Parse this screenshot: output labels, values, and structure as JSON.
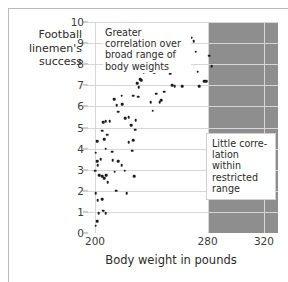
{
  "figure": {
    "ylabel": "Football linemen's success",
    "xlabel": "Body weight in pounds",
    "annotations": {
      "broad": "Greater correlation over broad range of body weights",
      "restricted": "Little corre-lation within restricted range"
    }
  },
  "colors": {
    "shaded_band": "#8e8e8e",
    "gridline": "#d6d6d6",
    "dot": "#1c1c1c",
    "text": "#2b2b2b",
    "frame": "#b9b9b9"
  },
  "chart_data": {
    "type": "scatter",
    "title": "",
    "xlabel": "Body weight in pounds",
    "ylabel": "Football linemen's success",
    "xlim": [
      195,
      330
    ],
    "ylim": [
      0,
      10
    ],
    "xticks": [
      200,
      280,
      320
    ],
    "yticks": [
      0,
      1,
      2,
      3,
      4,
      5,
      6,
      7,
      8,
      9,
      10
    ],
    "grid": true,
    "legend": null,
    "shaded_region": {
      "label": "restricted range",
      "x_start": 280,
      "x_end": 330,
      "color": "#8e8e8e"
    },
    "annotations": [
      {
        "text": "Greater correlation over broad range of body weights",
        "x": 212,
        "y": 9.6
      },
      {
        "text": "Little corre-lation within restricted range",
        "x": 288,
        "y": 4.7
      }
    ],
    "points": [
      [
        200.5,
        0.35
      ],
      [
        201.5,
        0.55
      ],
      [
        202.5,
        0.95
      ],
      [
        200.5,
        1.9
      ],
      [
        202.0,
        1.55
      ],
      [
        205.0,
        1.6
      ],
      [
        206.0,
        1.05
      ],
      [
        207.5,
        0.95
      ],
      [
        200.0,
        2.95
      ],
      [
        200.5,
        3.8
      ],
      [
        201.5,
        3.4
      ],
      [
        202.0,
        3.2
      ],
      [
        203.0,
        2.75
      ],
      [
        204.0,
        3.5
      ],
      [
        205.0,
        2.7
      ],
      [
        206.5,
        2.6
      ],
      [
        208.0,
        2.75
      ],
      [
        209.0,
        2.4
      ],
      [
        201.5,
        4.35
      ],
      [
        205.0,
        4.85
      ],
      [
        206.5,
        4.45
      ],
      [
        208.5,
        4.65
      ],
      [
        207.5,
        4.0
      ],
      [
        206.0,
        5.25
      ],
      [
        207.5,
        5.3
      ],
      [
        210.5,
        5.3
      ],
      [
        212.0,
        3.85
      ],
      [
        214.0,
        2.9
      ],
      [
        215.0,
        2.0
      ],
      [
        212.5,
        3.45
      ],
      [
        216.5,
        3.4
      ],
      [
        219.0,
        3.2
      ],
      [
        221.0,
        2.95
      ],
      [
        222.5,
        1.9
      ],
      [
        226.5,
        3.9
      ],
      [
        224.0,
        4.3
      ],
      [
        227.0,
        4.4
      ],
      [
        213.5,
        6.35
      ],
      [
        215.5,
        6.05
      ],
      [
        216.5,
        5.75
      ],
      [
        219.0,
        6.5
      ],
      [
        219.5,
        6.1
      ],
      [
        221.5,
        5.45
      ],
      [
        224.0,
        5.5
      ],
      [
        225.5,
        5.1
      ],
      [
        228.5,
        4.9
      ],
      [
        229.0,
        5.35
      ],
      [
        228.0,
        2.7
      ],
      [
        230.5,
        6.45
      ],
      [
        227.0,
        6.5
      ],
      [
        231.0,
        6.9
      ],
      [
        233.0,
        7.25
      ],
      [
        232.0,
        7.3
      ],
      [
        230.0,
        7.1
      ],
      [
        234.5,
        7.6
      ],
      [
        236.5,
        7.9
      ],
      [
        238.5,
        8.0
      ],
      [
        243.0,
        8.1
      ],
      [
        242.0,
        7.6
      ],
      [
        240.5,
        7.8
      ],
      [
        239.5,
        6.2
      ],
      [
        243.5,
        6.6
      ],
      [
        241.0,
        5.8
      ],
      [
        246.0,
        6.2
      ],
      [
        247.0,
        6.3
      ],
      [
        249.0,
        6.7
      ],
      [
        248.0,
        7.8
      ],
      [
        252.0,
        8.95
      ],
      [
        253.5,
        7.55
      ],
      [
        255.0,
        7.0
      ],
      [
        256.5,
        6.95
      ],
      [
        258.0,
        9.25
      ],
      [
        259.5,
        8.45
      ],
      [
        261.0,
        7.65
      ],
      [
        262.0,
        6.95
      ],
      [
        266.5,
        9.15
      ],
      [
        268.5,
        9.25
      ],
      [
        270.0,
        9.1
      ],
      [
        271.5,
        8.6
      ],
      [
        273.0,
        7.65
      ],
      [
        274.0,
        6.95
      ],
      [
        277.5,
        7.2
      ],
      [
        279.0,
        7.2
      ],
      [
        281.0,
        8.4
      ],
      [
        283.0,
        7.9
      ],
      [
        264.0,
        8.6
      ]
    ]
  }
}
